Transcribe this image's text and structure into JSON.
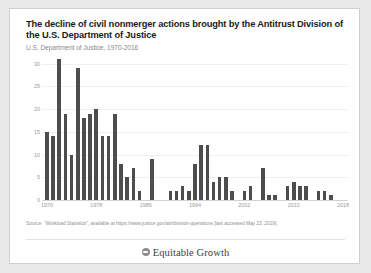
{
  "card": {
    "title": "The decline of civil nonmerger actions brought by the Antitrust Division of the U.S. Department of Justice",
    "subtitle": "U.S. Department of Justice, 1970-2016",
    "source": "Source: “Workload Statistics”, available at https://www.justice.gov/atr/division-operations [last accessed May 23, 2019].",
    "logo_text": "Equitable Growth",
    "logo_icon": "globe-icon",
    "bar_color": "#4d4d4d",
    "grid_color": "#efefef",
    "axis_color": "#d2d2d2",
    "label_color": "#9a9a9a"
  },
  "chart_data": {
    "type": "bar",
    "title": "The decline of civil nonmerger actions brought by the Antitrust Division of the U.S. Department of Justice",
    "subtitle": "U.S. Department of Justice, 1970-2016",
    "xlabel": "",
    "ylabel": "",
    "ylim": [
      0,
      31
    ],
    "yticks": [
      0,
      5,
      10,
      15,
      20,
      25,
      30
    ],
    "xticks": [
      1970,
      1978,
      1986,
      1994,
      2002,
      2010,
      2018
    ],
    "xlim": [
      1969.2,
      2018.8
    ],
    "grid": true,
    "legend": false,
    "categories": [
      1970,
      1971,
      1972,
      1973,
      1974,
      1975,
      1976,
      1977,
      1978,
      1979,
      1980,
      1981,
      1982,
      1983,
      1984,
      1985,
      1986,
      1987,
      1988,
      1989,
      1990,
      1991,
      1992,
      1993,
      1994,
      1995,
      1996,
      1997,
      1998,
      1999,
      2000,
      2001,
      2002,
      2003,
      2004,
      2005,
      2006,
      2007,
      2008,
      2009,
      2010,
      2011,
      2012,
      2013,
      2014,
      2015,
      2016
    ],
    "values": [
      15,
      14,
      31,
      19,
      10,
      29,
      18,
      19,
      20,
      14,
      14,
      19,
      8,
      5,
      7,
      2,
      0,
      9,
      0,
      0,
      2,
      2,
      3,
      2,
      8,
      12,
      12,
      4,
      5,
      5,
      2,
      0,
      2,
      3,
      0,
      7,
      1,
      1,
      0,
      3,
      4,
      3,
      3,
      0,
      2,
      2,
      1
    ]
  }
}
